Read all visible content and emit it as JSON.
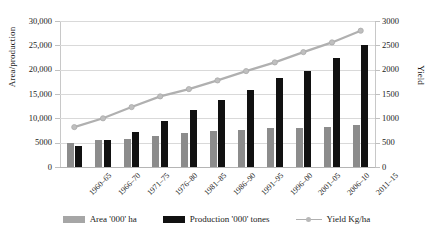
{
  "chart_data": {
    "type": "bar",
    "title": "",
    "xlabel": "",
    "ylabel": "Area/production",
    "y2label": "Yield",
    "ylim": [
      0,
      30000
    ],
    "y2lim": [
      0,
      3000
    ],
    "grid": true,
    "legend_position": "bottom",
    "categories": [
      "1960–65",
      "1966–70",
      "1971–75",
      "1976–80",
      "1981–85",
      "1986–90",
      "1991–95",
      "1996–00",
      "2001–05",
      "2006–10",
      "2011–15"
    ],
    "yticks": [
      "0",
      "5000",
      "10,000",
      "15,000",
      "20,000",
      "25,000",
      "30,000"
    ],
    "yticks_values": [
      0,
      5000,
      10000,
      15000,
      20000,
      25000,
      30000
    ],
    "y2ticks": [
      "0",
      "500",
      "1000",
      "1500",
      "2000",
      "2500",
      "3000"
    ],
    "y2ticks_values": [
      0,
      500,
      1000,
      1500,
      2000,
      2500,
      3000
    ],
    "series": [
      {
        "name": "Area  '000' ha",
        "type": "bar",
        "axis": "left",
        "color": "#8c8c8c",
        "values": [
          5000,
          5600,
          5750,
          6350,
          7000,
          7450,
          7600,
          8000,
          8100,
          8300,
          8700
        ]
      },
      {
        "name": "Production  '000' tones",
        "type": "bar",
        "axis": "left",
        "color": "#111111",
        "values": [
          4300,
          5600,
          7150,
          9400,
          11700,
          13700,
          15900,
          18200,
          19700,
          22500,
          25000
        ]
      },
      {
        "name": "Yield Kg/ha",
        "type": "line",
        "axis": "right",
        "color": "#b0b0b0",
        "values": [
          820,
          1000,
          1230,
          1450,
          1600,
          1780,
          1970,
          2150,
          2360,
          2560,
          2800
        ]
      }
    ]
  },
  "legend": {
    "items": [
      {
        "label": "Area  '000' ha",
        "kind": "bar-gray"
      },
      {
        "label": "Production  '000' tones",
        "kind": "bar-black"
      },
      {
        "label": "Yield Kg/ha",
        "kind": "line-marker"
      }
    ]
  }
}
